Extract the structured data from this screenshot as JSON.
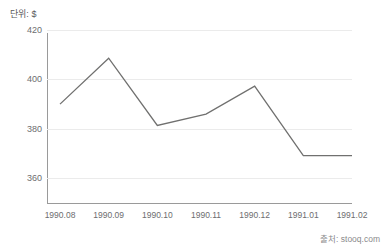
{
  "unit_label": "단위: $",
  "source_label": "출처: stooq.com",
  "accent_color": "#70706f",
  "grid_color": "#ebebeb",
  "axis_color": "#9a9a9a",
  "tick_text_color": "#6d6d6f",
  "chart_data": {
    "type": "line",
    "title": "",
    "subtitle": "",
    "xlabel": "",
    "ylabel": "단위: $",
    "categories": [
      "1990.08",
      "1990.09",
      "1990.10",
      "1990.11",
      "1990.12",
      "1991.01",
      "1991.02"
    ],
    "values": [
      390.0,
      408.6,
      381.4,
      386.0,
      397.3,
      369.2,
      369.2
    ],
    "series": [
      {
        "name": "Price",
        "values": [
          390.0,
          408.6,
          381.4,
          386.0,
          397.3,
          369.2,
          369.2
        ]
      }
    ],
    "ylim": [
      350,
      420
    ],
    "yticks": [
      360,
      380,
      400,
      420
    ],
    "ytick_labels": [
      "360",
      "380",
      "400",
      "420"
    ],
    "xtick_labels": [
      "1990.08",
      "1990.09",
      "1990.10",
      "1990.11",
      "1990.12",
      "1991.01",
      "1991.02"
    ],
    "grid": true,
    "grid_axis": "y",
    "legend": false,
    "legend_position": "none",
    "line_color": "#70706f",
    "line_width": 1.3,
    "markers": false
  }
}
